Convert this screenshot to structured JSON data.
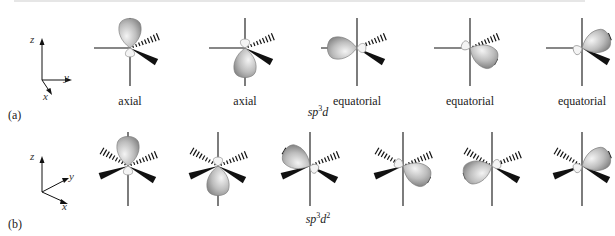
{
  "rows": [
    {
      "part_label": "(a)",
      "hybridization": {
        "base": "sp",
        "sup": "3",
        "tail": "d"
      },
      "axes": {
        "z": "z",
        "y": "y",
        "x": "x"
      },
      "orbitals": [
        {
          "label": "axial",
          "direction": "up"
        },
        {
          "label": "axial",
          "direction": "down"
        },
        {
          "label": "equatorial",
          "direction": "left"
        },
        {
          "label": "equatorial",
          "direction": "front-right"
        },
        {
          "label": "equatorial",
          "direction": "back-right"
        }
      ]
    },
    {
      "part_label": "(b)",
      "hybridization": {
        "base": "sp",
        "sup": "3",
        "tail": "d",
        "sup2": "2"
      },
      "axes": {
        "z": "z",
        "y": "y",
        "x": "x"
      },
      "orbitals": [
        {
          "direction": "up"
        },
        {
          "direction": "down"
        },
        {
          "direction": "back-left"
        },
        {
          "direction": "front-right"
        },
        {
          "direction": "front-left"
        },
        {
          "direction": "back-right"
        }
      ]
    }
  ],
  "colors": {
    "lobe_fill": "#b8b8b8",
    "lobe_highlight": "#f2f2f2",
    "line": "#111111"
  }
}
